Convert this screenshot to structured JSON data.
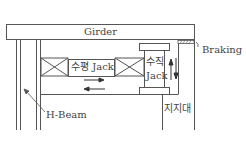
{
  "labels": {
    "girder": "Girder",
    "braking": "Braking",
    "horizontal_jack": "수평 Jack",
    "vertical_jack_line1": "수직",
    "vertical_jack_line2": "Jack",
    "h_beam": "H-Beam",
    "support": "지지대"
  },
  "colors": {
    "line": "#555555",
    "background": "#ffffff",
    "text": "#444444"
  }
}
